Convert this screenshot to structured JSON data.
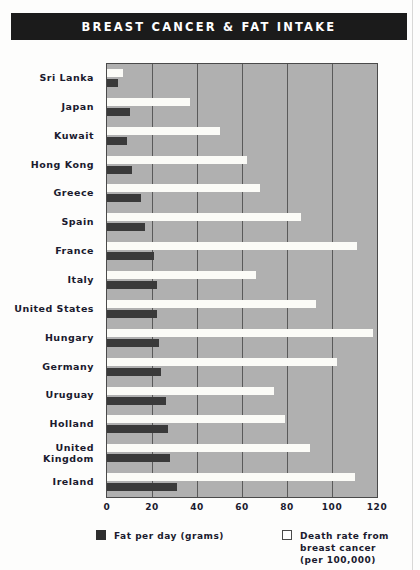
{
  "title": "BREAST CANCER & FAT INTAKE",
  "colors": {
    "title_bar": "#1b1b1b",
    "title_text": "#ffffff",
    "plot_background": "#b0b0b0",
    "gridline": "#5a5a5a",
    "fat_bar": "#3a3a3a",
    "death_bar": "#fbfbf7",
    "label_text": "#1a1a2e"
  },
  "legend": {
    "fat": {
      "label": "Fat per day (grams)",
      "swatch": "dark-filled-square"
    },
    "death": {
      "label": "Death rate from breast cancer\n(per 100,000)",
      "swatch": "white-outlined-square"
    }
  },
  "chart_data": {
    "type": "bar",
    "orientation": "horizontal",
    "title": "BREAST CANCER & FAT INTAKE",
    "xlabel": "",
    "ylabel": "",
    "xlim": [
      0,
      120
    ],
    "xticks": [
      0,
      20,
      40,
      60,
      80,
      100,
      120
    ],
    "xtick_labels": [
      "0",
      "20",
      "40",
      "60",
      "80",
      "100",
      "120"
    ],
    "grid": true,
    "grid_axis": "x",
    "legend_position": "below",
    "categories": [
      "Sri Lanka",
      "Japan",
      "Kuwait",
      "Hong Kong",
      "Greece",
      "Spain",
      "France",
      "Italy",
      "United States",
      "Hungary",
      "Germany",
      "Uruguay",
      "Holland",
      "United Kingdom",
      "Ireland"
    ],
    "series": [
      {
        "name": "Death rate from breast cancer (per 100,000)",
        "values": [
          7,
          37,
          50,
          62,
          68,
          86,
          111,
          66,
          93,
          118,
          102,
          74,
          79,
          90,
          110
        ]
      },
      {
        "name": "Fat per day (grams)",
        "values": [
          5,
          10,
          9,
          11,
          15,
          17,
          21,
          22,
          22,
          23,
          24,
          26,
          27,
          28,
          31
        ]
      }
    ]
  }
}
